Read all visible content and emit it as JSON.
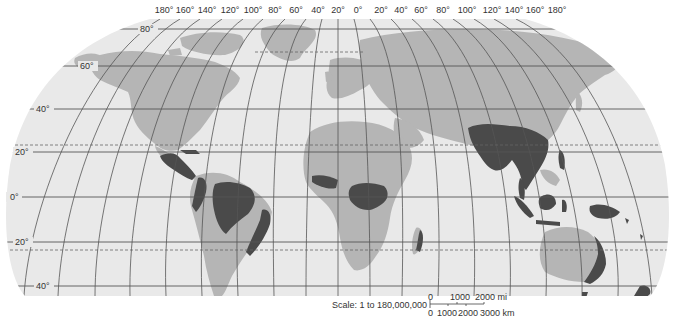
{
  "map": {
    "projection": "Robinson-style world map",
    "colors": {
      "background": "#ffffff",
      "ocean": "#e9e9e9",
      "land": "#b5b5b5",
      "rainforest": "#4a4a4a",
      "graticule": "#555555"
    },
    "longitude_labels": [
      "180°",
      "160°",
      "140°",
      "120°",
      "100°",
      "80°",
      "60°",
      "40°",
      "20°",
      "0°",
      "20°",
      "40°",
      "60°",
      "80°",
      "100°",
      "120°",
      "140°",
      "160°",
      "180°"
    ],
    "latitude_labels": {
      "lat80": "80°",
      "lat60": "60°",
      "lat40n": "40°",
      "lat20n": "20°",
      "lat0": "0°",
      "lat20s": "20°",
      "lat40s": "40°"
    },
    "dashed_lines": [
      "Tropic of Cancer",
      "Tropic of Capricorn",
      "Arctic Circle"
    ],
    "shaded_regions": [
      "Central America",
      "Amazon Basin",
      "Atlantic coast of Brazil",
      "West Africa",
      "Congo Basin",
      "Madagascar",
      "South & Southeast Asia",
      "Indonesia",
      "New Guinea",
      "Northeast Australia",
      "New Zealand"
    ]
  },
  "scale": {
    "text": "Scale: 1 to 180,000,000",
    "miles": {
      "t0": "0",
      "t1": "1000",
      "t2": "2000 mi"
    },
    "km": {
      "t0": "0",
      "t1": "1000",
      "t2": "2000",
      "t3": "3000 km"
    }
  }
}
